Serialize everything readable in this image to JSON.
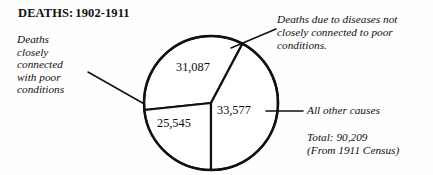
{
  "figure": {
    "title_lead": "DEATHS:",
    "title_range": "1902-1911",
    "background_color": "#fefefe",
    "ink_color": "#111111"
  },
  "annotations": {
    "left": "Deaths\ncloselyW\nconnected\nwith poor\nconditions",
    "left_lines": [
      "Deaths",
      "closely",
      "connected",
      "with poor",
      "conditions"
    ],
    "top_right": "Deaths due to diseases not\nclosely connected to poor\nconditions.",
    "other_causes": "All other causes",
    "total": "Total: 90,209\n(From 1911 Census)"
  },
  "chart_data": {
    "type": "pie",
    "subtitle": "",
    "xlabel": "",
    "ylabel": "",
    "total": 90209,
    "total_label": "Total: 90,209",
    "source_note": "(From 1911 Census)",
    "legend_position": "callout-annotations",
    "grid": false,
    "categories": [
      "Deaths due to diseases not closely connected to poor conditions.",
      "Deaths closely connected with poor conditions",
      "All other causes"
    ],
    "values": [
      31087,
      25545,
      33577
    ],
    "value_labels": [
      "31,087",
      "25,545",
      "33,577"
    ],
    "percentages": [
      34.5,
      28.3,
      37.2
    ],
    "slices": [
      {
        "label": "31,087",
        "value": 31087,
        "category": "Deaths due to diseases not closely connected to poor conditions.",
        "start_angle_deg": 174,
        "end_angle_deg": 298,
        "fill": "#ffffff",
        "stroke": "#111111"
      },
      {
        "label": "25,545",
        "value": 25545,
        "category": "Deaths closely connected with poor conditions",
        "start_angle_deg": 90,
        "end_angle_deg": 174,
        "fill": "#ffffff",
        "stroke": "#111111"
      },
      {
        "label": "33,577",
        "value": 33577,
        "category": "All other causes",
        "start_angle_deg": 298,
        "end_angle_deg": 450,
        "fill": "#ffffff",
        "stroke": "#111111"
      }
    ],
    "geometry": {
      "center_x": 211,
      "center_y": 103,
      "radius": 67
    }
  }
}
